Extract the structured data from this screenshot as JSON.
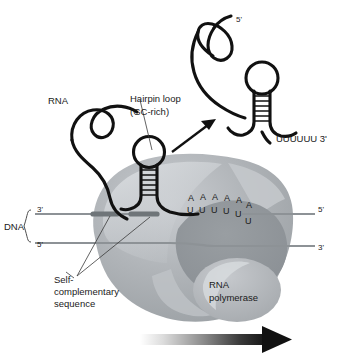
{
  "figure": {
    "background_color": "#ffffff"
  },
  "labels": {
    "rna": "RNA",
    "hairpin_loop": "Hairpin loop",
    "hairpin_gc": "(GC-rich)",
    "dna": "DNA",
    "self_complementary_line1": "Self-",
    "self_complementary_line2": "complementary",
    "self_complementary_line3": "sequence",
    "rna_polymerase_line1": "RNA",
    "rna_polymerase_line2": "polymerase",
    "released_rna_5prime": "5'",
    "released_rna_3prime_tail": "UUUUUU  3'",
    "dna_left_top": "3'",
    "dna_left_bottom": "5'",
    "dna_right_top": "5'",
    "dna_right_bottom": "3'"
  },
  "base_pairs": {
    "top_strand_label": "A",
    "bottom_strand_label": "U",
    "count": 6,
    "top_bases": [
      "A",
      "A",
      "A",
      "A",
      "A",
      "A"
    ],
    "bottom_bases": [
      "U",
      "U",
      "U",
      "U",
      "U",
      "U"
    ]
  },
  "hairpins": {
    "attached": {
      "stem_rungs": 6,
      "name": "nascent-rna-hairpin"
    },
    "released": {
      "stem_rungs": 6,
      "name": "released-rna-hairpin"
    }
  },
  "colors": {
    "rna_strand": "#111111",
    "dna_strand": "#8d9296",
    "self_complementary_segment": "#6f7579",
    "polymerase_body": "#a8acb0",
    "polymerase_highlight": "#c9ccd0",
    "polymerase_cavity": "#8e9398",
    "text": "#1a1a1a",
    "arrow": "#111111"
  },
  "direction_arrow": {
    "name": "transcription-direction-arrow",
    "description": "gradient arrow pointing right",
    "from_color": "#f2f2f2",
    "to_color": "#111111"
  }
}
